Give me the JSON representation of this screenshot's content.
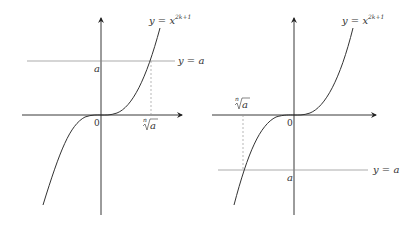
{
  "figure": {
    "left_panel": {
      "curve_label": "y = x",
      "curve_exponent": "2k+1",
      "hline_label": "y = a",
      "y_tick_label": "a",
      "origin_label": "0",
      "x_tick_root_index": "n",
      "x_tick_radicand": "a",
      "case": "a > 0"
    },
    "right_panel": {
      "curve_label": "y = x",
      "curve_exponent": "2k+1",
      "hline_label": "y = a",
      "y_tick_label": "a",
      "origin_label": "0",
      "x_tick_root_index": "n",
      "x_tick_radicand": "a",
      "case": "a < 0"
    }
  },
  "colors": {
    "axis": "#222222",
    "curve": "#333333",
    "hline": "#888888",
    "dashed": "#999999"
  }
}
